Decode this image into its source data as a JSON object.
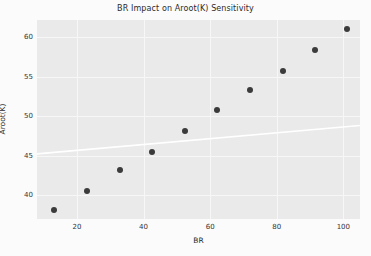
{
  "chart_data": {
    "type": "scatter",
    "title": "BR Impact on Aroot(K) Sensitivity",
    "xlabel": "BR",
    "ylabel": "Aroot(K)",
    "xlim": [
      8,
      105
    ],
    "ylim": [
      37.0,
      62.2
    ],
    "xticks": [
      20,
      40,
      60,
      80,
      100
    ],
    "yticks": [
      40,
      45,
      50,
      55,
      60
    ],
    "grid": true,
    "legend": null,
    "series": [
      {
        "name": "observations",
        "marker": "circle",
        "color": "#3b3b3b",
        "points": [
          {
            "x": 13.0,
            "y": 38.2
          },
          {
            "x": 23.0,
            "y": 40.6
          },
          {
            "x": 33.0,
            "y": 43.2
          },
          {
            "x": 42.5,
            "y": 45.5
          },
          {
            "x": 52.5,
            "y": 48.1
          },
          {
            "x": 62.0,
            "y": 50.8
          },
          {
            "x": 72.0,
            "y": 53.3
          },
          {
            "x": 82.0,
            "y": 55.8
          },
          {
            "x": 91.5,
            "y": 58.4
          },
          {
            "x": 101.0,
            "y": 61.0
          }
        ]
      }
    ],
    "trendline": {
      "name": "trend",
      "color": "#ffffff",
      "x_start": 8,
      "y_start": 45.25,
      "x_end": 105,
      "y_end": 48.85
    },
    "plot_bgcolor": "#eaeaea",
    "figure_bgcolor": "#fbfbfb",
    "gridcolor": "#f7f7f7"
  },
  "axis": {
    "x_tick_labels": [
      "20",
      "40",
      "60",
      "80",
      "100"
    ],
    "y_tick_labels": [
      "40",
      "45",
      "50",
      "55",
      "60"
    ]
  }
}
